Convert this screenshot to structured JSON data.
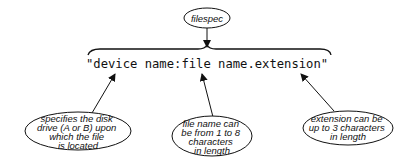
{
  "diagram": {
    "title_node": {
      "label": "filespec"
    },
    "filespec_string": "\"device name:file name.extension\"",
    "callouts": [
      {
        "id": "device",
        "lines": [
          "specifies the disk",
          "drive (A or B) upon",
          "which the file",
          "is located"
        ]
      },
      {
        "id": "filename",
        "lines": [
          "file name can",
          "be from 1 to 8",
          "characters",
          "in length"
        ]
      },
      {
        "id": "extension",
        "lines": [
          "extension can be",
          "up to 3 characters",
          "in length"
        ]
      }
    ]
  }
}
